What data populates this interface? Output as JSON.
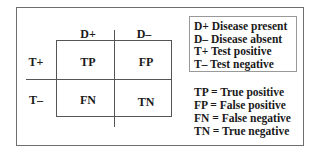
{
  "matrix": {
    "column_headers": [
      "D+",
      "D–"
    ],
    "row_headers": [
      "T+",
      "T–"
    ],
    "cells": [
      [
        "TP",
        "FP"
      ],
      [
        "FN",
        "TN"
      ]
    ]
  },
  "legend": [
    "D+ Disease present",
    "D– Disease absent",
    "T+ Test positive",
    "T– Test negative"
  ],
  "definitions": [
    "TP = True positive",
    "FP = False positive",
    "FN = False negative",
    "TN = True negative"
  ],
  "colors": {
    "line": "#555555",
    "text": "#1a1a1a",
    "frame": "#6e6e6e"
  }
}
